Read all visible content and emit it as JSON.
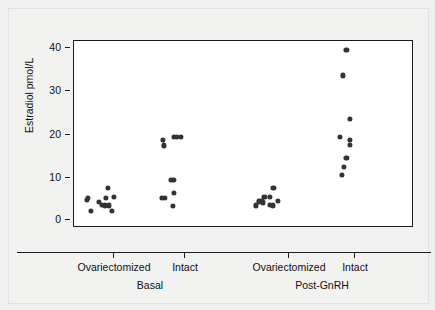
{
  "chart_data": {
    "type": "scatter",
    "title": "",
    "xlabel": "",
    "ylabel": "Estradiol pmol/L",
    "ylim": [
      0,
      43
    ],
    "yticks": [
      0,
      10,
      20,
      30,
      40
    ],
    "ytick_labels": [
      "0",
      "10",
      "20",
      "30",
      "40"
    ],
    "grid": false,
    "legend": null,
    "x_categories": [
      "Ovariectomized",
      "Intact",
      "Ovariectomized",
      "Intact"
    ],
    "x_group_labels": [
      "Basal",
      "Post-GnRH"
    ],
    "groups": [
      {
        "name": "Basal / Ovariectomized",
        "condition": "Basal",
        "status": "Ovariectomized",
        "values": [
          4.0,
          6.5,
          6.8,
          6.0,
          5.5,
          5.3,
          5.3,
          7.0,
          9.2,
          7.2,
          3.9
        ]
      },
      {
        "name": "Basal / Intact",
        "condition": "Basal",
        "status": "Intact",
        "values": [
          20.2,
          19.0,
          21.0,
          21.0,
          11.0,
          11.1,
          7.0,
          7.0,
          8.1,
          5.1
        ]
      },
      {
        "name": "Post-GnRH / Ovariectomized",
        "condition": "Post-GnRH",
        "status": "Ovariectomized",
        "values": [
          5.2,
          6.0,
          6.2,
          7.2,
          7.2,
          5.2,
          5.3,
          9.3,
          6.2,
          5.9
        ]
      },
      {
        "name": "Post-GnRH / Intact",
        "condition": "Post-GnRH",
        "status": "Intact",
        "values": [
          41.0,
          35.1,
          25.0,
          21.0,
          20.2,
          19.1,
          16.2,
          14.0,
          12.2
        ]
      }
    ],
    "points": [
      {
        "g": 0,
        "x": 0.195,
        "y": 4.0
      },
      {
        "g": 0,
        "x": 0.15,
        "y": 6.5
      },
      {
        "g": 0,
        "x": 0.16,
        "y": 6.9
      },
      {
        "g": 0,
        "x": 0.29,
        "y": 6.0
      },
      {
        "g": 0,
        "x": 0.33,
        "y": 5.3
      },
      {
        "g": 0,
        "x": 0.36,
        "y": 5.2
      },
      {
        "g": 0,
        "x": 0.41,
        "y": 5.2
      },
      {
        "g": 0,
        "x": 0.38,
        "y": 7.0
      },
      {
        "g": 0,
        "x": 0.4,
        "y": 9.2
      },
      {
        "g": 0,
        "x": 0.47,
        "y": 7.2
      },
      {
        "g": 0,
        "x": 0.45,
        "y": 3.9
      },
      {
        "g": 1,
        "x": 0.05,
        "y": 20.2
      },
      {
        "g": 1,
        "x": 0.062,
        "y": 19.0
      },
      {
        "g": 1,
        "x": 0.18,
        "y": 21.0
      },
      {
        "g": 1,
        "x": 0.215,
        "y": 21.0
      },
      {
        "g": 1,
        "x": 0.255,
        "y": 21.0
      },
      {
        "g": 1,
        "x": 0.145,
        "y": 11.0
      },
      {
        "g": 1,
        "x": 0.175,
        "y": 11.1
      },
      {
        "g": 1,
        "x": 0.035,
        "y": 7.0
      },
      {
        "g": 1,
        "x": 0.07,
        "y": 7.0
      },
      {
        "g": 1,
        "x": 0.18,
        "y": 8.1
      },
      {
        "g": 1,
        "x": 0.16,
        "y": 5.1
      },
      {
        "g": 2,
        "x": 0.14,
        "y": 5.2
      },
      {
        "g": 2,
        "x": 0.175,
        "y": 6.1
      },
      {
        "g": 2,
        "x": 0.205,
        "y": 6.3
      },
      {
        "g": 2,
        "x": 0.24,
        "y": 7.2
      },
      {
        "g": 2,
        "x": 0.3,
        "y": 7.2
      },
      {
        "g": 2,
        "x": 0.3,
        "y": 5.3
      },
      {
        "g": 2,
        "x": 0.34,
        "y": 5.2
      },
      {
        "g": 2,
        "x": 0.345,
        "y": 9.3
      },
      {
        "g": 2,
        "x": 0.395,
        "y": 6.2
      },
      {
        "g": 2,
        "x": 0.225,
        "y": 5.9
      },
      {
        "g": 3,
        "x": 0.205,
        "y": 41.0
      },
      {
        "g": 3,
        "x": 0.165,
        "y": 35.1
      },
      {
        "g": 3,
        "x": 0.245,
        "y": 25.0
      },
      {
        "g": 3,
        "x": 0.13,
        "y": 21.0
      },
      {
        "g": 3,
        "x": 0.25,
        "y": 20.2
      },
      {
        "g": 3,
        "x": 0.25,
        "y": 19.1
      },
      {
        "g": 3,
        "x": 0.205,
        "y": 16.2
      },
      {
        "g": 3,
        "x": 0.175,
        "y": 14.0
      },
      {
        "g": 3,
        "x": 0.15,
        "y": 12.2
      }
    ]
  },
  "axes": {
    "ylabel": "Estradiol pmol/L",
    "ytick_labels": [
      "40",
      "30",
      "20",
      "10",
      "0"
    ],
    "xtick_labels": [
      "Ovariectomized",
      "Intact",
      "Ovariectomized",
      "Intact"
    ],
    "xgroup_labels": [
      "Basal",
      "Post-GnRH"
    ]
  },
  "style": {
    "point_color": "#333335",
    "axis_color": "#1b1b1b",
    "plot_background": "#ffffff",
    "figure_background": "#efefef"
  }
}
